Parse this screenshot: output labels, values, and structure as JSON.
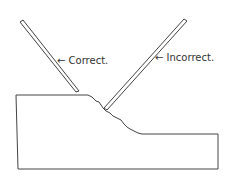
{
  "diagram": {
    "labels": {
      "correct": "Correct.",
      "incorrect": "Incorrect."
    },
    "arrow_glyph": "←",
    "stroke_color": "#444444"
  }
}
